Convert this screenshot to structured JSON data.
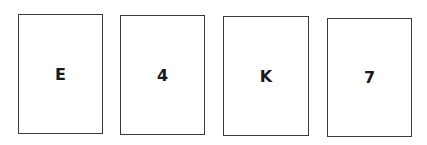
{
  "cards": [
    {
      "label": "E"
    },
    {
      "label": "4"
    },
    {
      "label": "K"
    },
    {
      "label": "7"
    }
  ],
  "colors": {
    "border": "#3a3a3a",
    "text": "#1a1a1a",
    "background": "#ffffff"
  }
}
